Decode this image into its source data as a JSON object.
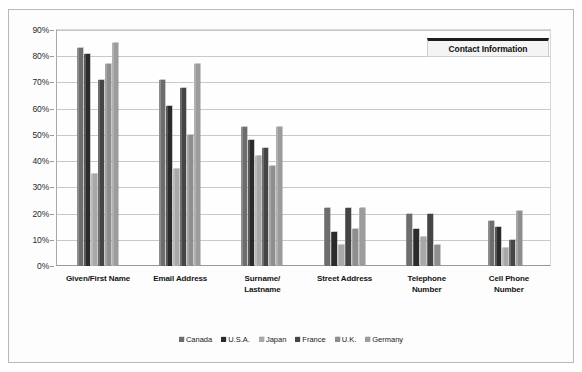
{
  "chart_data": {
    "type": "bar",
    "title": "Contact Information",
    "xlabel": "",
    "ylabel": "",
    "ylim": [
      0,
      90
    ],
    "ytick_labels": [
      "90%",
      "80%",
      "70%",
      "60%",
      "50%",
      "40%",
      "30%",
      "20%",
      "10%",
      "0%"
    ],
    "ytick_values": [
      90,
      80,
      70,
      60,
      50,
      40,
      30,
      20,
      10,
      0
    ],
    "grid": true,
    "legend_position": "bottom",
    "categories": [
      "Given/First Name",
      "Email Address",
      "Surname/\nLastname",
      "Street Address",
      "Telephone\nNumber",
      "Cell Phone\nNumber"
    ],
    "series": [
      {
        "name": "Canada",
        "color": "#6d6d6d",
        "values": [
          83,
          71,
          53,
          22,
          20,
          17
        ]
      },
      {
        "name": "U.S.A.",
        "color": "#2b2b2b",
        "values": [
          81,
          61,
          48,
          13,
          14,
          15
        ]
      },
      {
        "name": "Japan",
        "color": "#a8a8a8",
        "values": [
          35,
          37,
          42,
          8,
          11,
          7
        ]
      },
      {
        "name": "France",
        "color": "#454545",
        "values": [
          71,
          68,
          45,
          22,
          20,
          10
        ]
      },
      {
        "name": "U.K.",
        "color": "#8e8e8e",
        "values": [
          77,
          50,
          38,
          14,
          8,
          21
        ]
      },
      {
        "name": "Germany",
        "color": "#9c9c9c",
        "values": [
          85,
          77,
          53,
          22,
          0,
          0
        ]
      }
    ]
  },
  "legend": {
    "items": [
      "Canada",
      "U.S.A.",
      "Japan",
      "France",
      "U.K.",
      "Germany"
    ]
  },
  "categories_display": [
    "Given/First Name",
    "Email Address",
    "Surname/ Lastname",
    "Street Address",
    "Telephone Number",
    "Cell Phone Number"
  ]
}
